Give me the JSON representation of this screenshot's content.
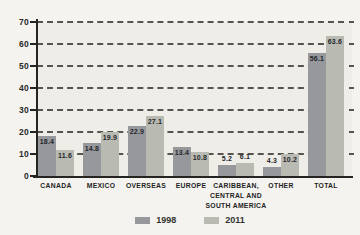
{
  "chart_data": {
    "type": "bar",
    "title": "",
    "xlabel": "",
    "ylabel": "",
    "categories": [
      "CANADA",
      "MEXICO",
      "OVERSEAS",
      "EUROPE",
      "CARIBBEAN,\nCENTRAL AND\nSOUTH AMERICA",
      "OTHER",
      "TOTAL"
    ],
    "series": [
      {
        "name": "1998",
        "color": "#96989b",
        "values": [
          18.4,
          14.8,
          22.9,
          13.4,
          5.2,
          4.3,
          56.1
        ]
      },
      {
        "name": "2011",
        "color": "#b9bbb2",
        "values": [
          11.6,
          19.9,
          27.1,
          10.8,
          6.1,
          10.2,
          63.6
        ]
      }
    ],
    "ylim": [
      0,
      70
    ],
    "yticks": [
      0,
      10,
      20,
      30,
      40,
      50,
      60,
      70
    ],
    "grid": "dashed-horizontal",
    "value_labels": true,
    "legend_position": "bottom-center"
  },
  "colors": {
    "background": "#f4f3ef",
    "plot_background": "#eeede8",
    "axis": "#262420",
    "gridline": "#56544f",
    "tick_label": "#2b2a28",
    "value_label": "#25272c",
    "category_label": "#242424",
    "legend_label": "#333333"
  }
}
